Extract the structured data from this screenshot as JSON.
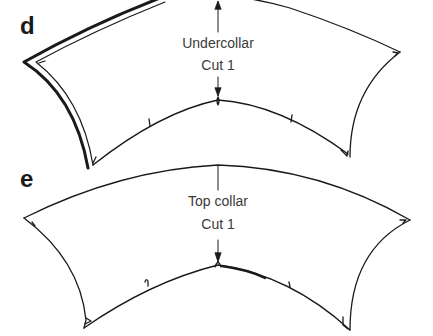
{
  "panels": [
    {
      "id": "d",
      "label": "d",
      "piece_name": "Undercollar",
      "cut_instruction": "Cut 1"
    },
    {
      "id": "e",
      "label": "e",
      "piece_name": "Top collar",
      "cut_instruction": "Cut 1"
    }
  ],
  "colors": {
    "line": "#1a1a1a",
    "text": "#3a3a3a",
    "background": "#ffffff"
  }
}
